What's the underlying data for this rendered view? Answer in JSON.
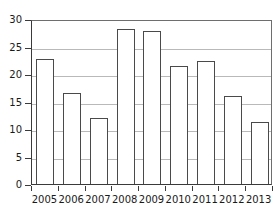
{
  "chart_data": {
    "type": "bar",
    "title": "",
    "subtitle": "",
    "xlabel": "",
    "ylabel": "",
    "categories": [
      "2005",
      "2006",
      "2007",
      "2008",
      "2009",
      "2010",
      "2011",
      "2012",
      "2013"
    ],
    "values": [
      22.8,
      16.5,
      12.0,
      28.1,
      27.9,
      21.5,
      22.4,
      16.0,
      11.2
    ],
    "ylim": [
      0,
      30
    ],
    "ytick_values": [
      0,
      5,
      10,
      15,
      20,
      25,
      30
    ],
    "ytick_labels": [
      "0",
      "5",
      "10",
      "15",
      "20",
      "25",
      "30"
    ],
    "grid": true,
    "grid_axis": "y",
    "legend": false,
    "legend_position": "none",
    "bar_fill_color": "#ffffff",
    "bar_edge_color": "#4a4a4a",
    "grid_color": "#b9b9b9",
    "axis_color": "#3a3a3a",
    "background_color": "#ffffff",
    "text_color": "#1a1a1a"
  }
}
